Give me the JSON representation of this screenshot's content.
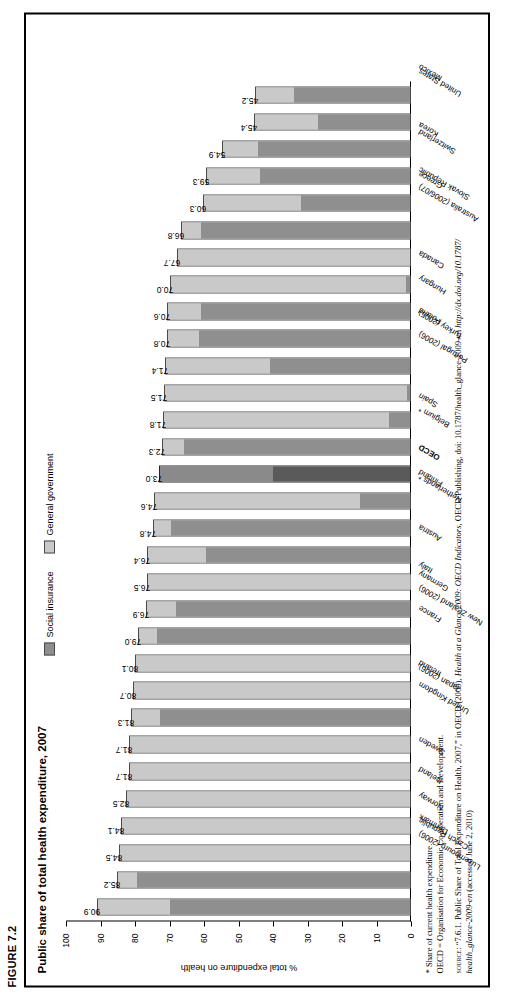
{
  "figure": {
    "label": "FIGURE 7.2",
    "title": "Public share of total health expenditure, 2007"
  },
  "legend": {
    "items": [
      {
        "label": "Social insurance",
        "color": "#8f8f8f",
        "key": "social_insurance"
      },
      {
        "label": "General government",
        "color": "#c9c9c9",
        "key": "general_government"
      }
    ]
  },
  "axis": {
    "ylabel": "% total expenditure on health",
    "ticks": [
      "100",
      "90",
      "80",
      "70",
      "60",
      "50",
      "40",
      "30",
      "20",
      "10",
      "0"
    ]
  },
  "notes": {
    "footnote": "* Share of current health expenditure.",
    "abbrev": "OECD = Organisation for Economic Co-operation and Development.",
    "source_label": "source:",
    "source_line1_a": " “7.6.1. Public Share of Total Expenditure on Health, 2007,” in OECD (2009), ",
    "source_line1_ital": "Health at a Glance 2009: OECD Indicators",
    "source_line1_b": ", OECD Publishing, doi: 10.1787/health_glance-2009-en ",
    "source_line1_c": "http://dx.doi.org/10.1787/",
    "source_line2_ital": "health_glance-2009-en",
    "source_line2_b": " (accessed June 2, 2010)"
  },
  "chart_data": {
    "type": "bar",
    "subtype": "stacked-column",
    "title": "Public share of total health expenditure, 2007",
    "xlabel": "",
    "ylabel": "% total expenditure on health",
    "ylim": [
      0,
      100
    ],
    "grid": false,
    "legend_position": "top-center",
    "categories": [
      "Luxembourg (2006)",
      "Czech Republic",
      "Denmark",
      "Norway",
      "Iceland",
      "Sweden",
      "United Kingdom",
      "Japan (2006)",
      "Ireland",
      "New Zealand (2006)",
      "France",
      "Germany",
      "Italy",
      "Austria",
      "Netherlands *",
      "Finland",
      "OECD",
      "Belgium *",
      "Spain",
      "Portugal (2006)",
      "Turkey (2005)",
      "Poland",
      "Hungary",
      "Canada",
      "Australia (2006/07)",
      "Slovak Republic",
      "Greece",
      "Switzerland",
      "Korea",
      "United States",
      "Mexico"
    ],
    "totals": [
      90.9,
      85.2,
      84.5,
      84.1,
      82.5,
      81.7,
      81.7,
      81.3,
      80.7,
      80.1,
      79.0,
      76.9,
      76.5,
      76.4,
      74.8,
      74.6,
      73.0,
      72.3,
      71.8,
      71.5,
      71.4,
      70.8,
      70.6,
      70.0,
      67.7,
      66.8,
      60.3,
      59.3,
      54.9,
      45.4,
      45.2
    ],
    "series": [
      {
        "name": "Social insurance",
        "values": [
          70.0,
          79.8,
          0.0,
          0.0,
          0.0,
          0.0,
          0.0,
          72.9,
          0.0,
          0.0,
          73.9,
          68.3,
          0.1,
          59.5,
          69.9,
          14.6,
          40.0,
          65.9,
          6.0,
          1.0,
          41.0,
          61.8,
          61.2,
          1.3,
          0.0,
          61.0,
          32.0,
          44.0,
          44.5,
          27.0,
          34.0
        ]
      },
      {
        "name": "General government",
        "values": [
          20.9,
          5.4,
          84.5,
          84.1,
          82.5,
          81.7,
          81.7,
          8.4,
          80.7,
          80.1,
          5.1,
          8.6,
          76.4,
          16.9,
          4.9,
          60.0,
          33.0,
          6.4,
          65.8,
          70.5,
          30.4,
          9.0,
          9.4,
          68.7,
          67.7,
          5.8,
          28.3,
          15.3,
          10.4,
          18.4,
          11.2
        ]
      }
    ],
    "highlight_category": "OECD",
    "data_labels": [
      "90.9",
      "85.2",
      "84.5",
      "84.1",
      "82.5",
      "81.7",
      "81.7",
      "81.3",
      "80.7",
      "80.1",
      "79.0",
      "76.9",
      "76.5",
      "76.4",
      "74.8",
      "74.6",
      "73.0",
      "72.3",
      "71.8",
      "71.5",
      "71.4",
      "70.8",
      "70.6",
      "70.0",
      "67.7",
      "66.8",
      "60.3",
      "59.3",
      "54.9",
      "45.4",
      "45.2"
    ]
  }
}
